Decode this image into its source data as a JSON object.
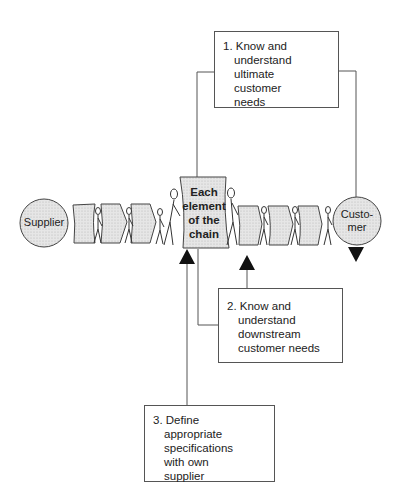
{
  "diagram": {
    "nodes": {
      "supplier": {
        "label": "Supplier"
      },
      "customer": {
        "label_line1": "Custo-",
        "label_line2": "mer"
      },
      "center": {
        "lines": [
          "Each",
          "element",
          "of the",
          "chain"
        ]
      }
    },
    "boxes": [
      {
        "id": "box1",
        "lines": [
          "1. Know and",
          "understand",
          "ultimate",
          "customer",
          "needs"
        ]
      },
      {
        "id": "box2",
        "lines": [
          "2. Know and",
          "understand",
          "downstream",
          "customer needs"
        ]
      },
      {
        "id": "box3",
        "lines": [
          "3. Define",
          "appropriate",
          "specifications",
          "with own",
          "supplier"
        ]
      }
    ],
    "colors": {
      "fill": "#dcdcdc",
      "stroke": "#444444",
      "background": "#ffffff"
    }
  }
}
